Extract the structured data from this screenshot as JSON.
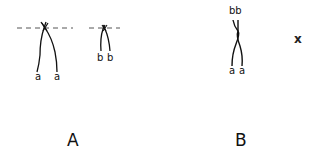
{
  "diagram": {
    "panels": [
      {
        "id": "A",
        "label": "A",
        "chromosomes": [
          {
            "name": "chromosome-a",
            "allele_labels": [
              "a",
              "a"
            ],
            "has_dashed_plane": true
          },
          {
            "name": "chromosome-b",
            "allele_labels": [
              "b",
              "b"
            ],
            "has_dashed_plane": true
          }
        ]
      },
      {
        "id": "B",
        "label": "B",
        "chromosomes": [
          {
            "name": "recombinant-chromosome",
            "top_label": "bb",
            "bottom_labels": [
              "a",
              "a"
            ]
          }
        ],
        "annotation": "x"
      }
    ],
    "colors": {
      "ink": "#111111",
      "dashed_line": "#555555",
      "background": "#ffffff"
    }
  }
}
